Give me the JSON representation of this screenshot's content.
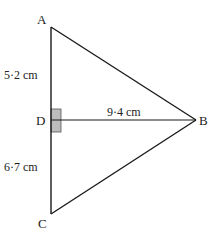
{
  "diagram": {
    "type": "triangle",
    "colors": {
      "line": "#1a1a1a",
      "right_angle_fill": "#bdbdbd",
      "right_angle_stroke": "#555555",
      "text": "#222222"
    },
    "vertices": {
      "A": {
        "label": "A",
        "x": 51,
        "y": 27
      },
      "B": {
        "label": "B",
        "x": 196,
        "y": 120
      },
      "C": {
        "label": "C",
        "x": 51,
        "y": 214
      },
      "D": {
        "label": "D",
        "x": 51,
        "y": 120
      }
    },
    "measurements": {
      "AD": "5·2 cm",
      "DB": "9·4 cm",
      "DC": "6·7 cm"
    },
    "right_angle_marker": "at D"
  }
}
